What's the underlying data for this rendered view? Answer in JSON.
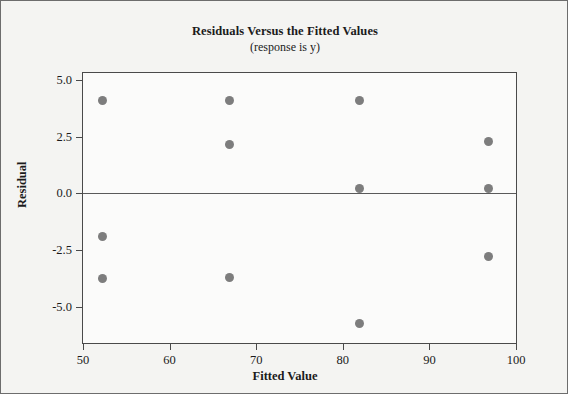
{
  "chart_data": {
    "type": "scatter",
    "title": "Residuals Versus the Fitted Values",
    "subtitle": "(response is y)",
    "xlabel": "Fitted Value",
    "ylabel": "Residual",
    "xlim": [
      50,
      100
    ],
    "ylim": [
      -6.6,
      5.3
    ],
    "xticks": [
      50,
      60,
      70,
      80,
      90,
      100
    ],
    "xtick_labels": [
      "50",
      "60",
      "70",
      "80",
      "90",
      "100"
    ],
    "yticks": [
      5.0,
      2.5,
      0.0,
      -2.5,
      -5.0
    ],
    "ytick_labels": [
      "5.0",
      "2.5",
      "0.0",
      "-2.5",
      "-5.0"
    ],
    "grid": false,
    "legend": null,
    "reference_line": {
      "y": 0.0,
      "color": "#5a5a5a"
    },
    "marker": {
      "shape": "circle",
      "color": "#7d7d7d",
      "size": 9
    },
    "points": [
      {
        "x": 52.2,
        "y": 4.1
      },
      {
        "x": 52.2,
        "y": -1.9
      },
      {
        "x": 52.2,
        "y": -3.75
      },
      {
        "x": 66.9,
        "y": 4.1
      },
      {
        "x": 66.9,
        "y": 2.15
      },
      {
        "x": 66.9,
        "y": -3.7
      },
      {
        "x": 81.9,
        "y": 4.1
      },
      {
        "x": 81.9,
        "y": 0.2
      },
      {
        "x": 81.9,
        "y": -5.75
      },
      {
        "x": 96.8,
        "y": 2.3
      },
      {
        "x": 96.8,
        "y": 0.2
      },
      {
        "x": 96.8,
        "y": -2.8
      }
    ]
  }
}
